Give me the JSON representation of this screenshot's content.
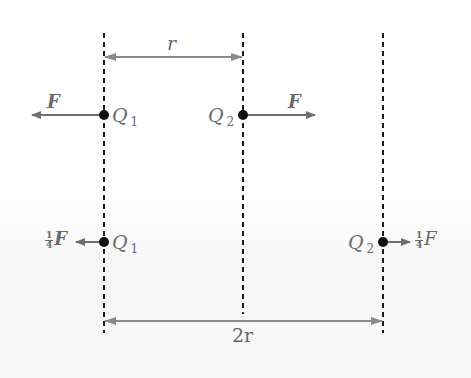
{
  "diagram": {
    "colors": {
      "dashed_line": "#1a1a1a",
      "arrow": "#6e6e6e",
      "dimension_arrow": "#8a8a8a",
      "charge_dot": "#111111",
      "label": "#6a6a6a"
    },
    "top_distance_label": "r",
    "bottom_distance_label": "2r",
    "row1": {
      "left_force_label": "F",
      "right_force_label": "F",
      "charge1_label": "Q",
      "charge1_sub": "1",
      "charge2_label": "Q",
      "charge2_sub": "2"
    },
    "row2": {
      "left_force_frac_num": "1",
      "left_force_frac_den": "4",
      "left_force_label": "F",
      "right_force_frac_num": "1",
      "right_force_frac_den": "4",
      "right_force_label": "F",
      "charge1_label": "Q",
      "charge1_sub": "1",
      "charge2_label": "Q",
      "charge2_sub": "2"
    }
  }
}
